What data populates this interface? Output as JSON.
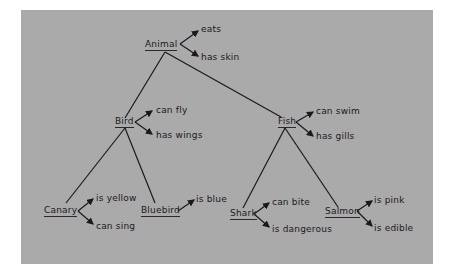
{
  "diagram": {
    "type": "semantic-network-tree",
    "nodes": {
      "animal": {
        "label": "Animal",
        "properties": [
          "eats",
          "has skin"
        ]
      },
      "bird": {
        "label": "Bird",
        "properties": [
          "can fly",
          "has wings"
        ]
      },
      "fish": {
        "label": "Fish",
        "properties": [
          "can swim",
          "has gills"
        ]
      },
      "canary": {
        "label": "Canary",
        "properties": [
          "is yellow",
          "can sing"
        ]
      },
      "bluebird": {
        "label": "Bluebird",
        "properties": [
          "is blue"
        ]
      },
      "shark": {
        "label": "Shark",
        "properties": [
          "can bite",
          "is dangerous"
        ]
      },
      "salmon": {
        "label": "Salmon",
        "properties": [
          "is pink",
          "is edible"
        ]
      }
    },
    "edges": [
      [
        "Animal",
        "Bird"
      ],
      [
        "Animal",
        "Fish"
      ],
      [
        "Bird",
        "Canary"
      ],
      [
        "Bird",
        "Bluebird"
      ],
      [
        "Fish",
        "Shark"
      ],
      [
        "Fish",
        "Salmon"
      ]
    ],
    "colors": {
      "background": "#aaaaaa",
      "ink": "#1a1a1a",
      "page": "#ffffff"
    }
  }
}
